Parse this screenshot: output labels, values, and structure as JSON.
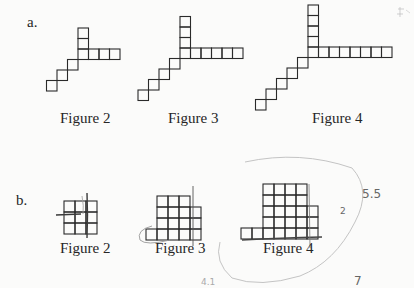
{
  "part_a": {
    "letter": "a.",
    "square_size": 10.5,
    "figures": [
      {
        "label": "Figure 2",
        "label_x": 60,
        "label_y": 111,
        "junction": [
          78,
          49
        ],
        "up": 2,
        "right": 3,
        "diag": 3
      },
      {
        "label": "Figure 3",
        "label_x": 168,
        "label_y": 111,
        "junction": [
          180,
          48
        ],
        "up": 3,
        "right": 5,
        "diag": 4
      },
      {
        "label": "Figure 4",
        "label_x": 312,
        "label_y": 111,
        "junction": [
          308,
          47
        ],
        "up": 4,
        "right": 7,
        "diag": 5
      }
    ]
  },
  "part_b": {
    "letter": "b.",
    "square_size": 11,
    "figures": [
      {
        "label": "Figure 2",
        "label_x": 60,
        "label_y": 241,
        "origin": [
          64,
          234
        ],
        "rows": [
          {
            "start": 0,
            "count": 3
          },
          {
            "start": 0,
            "count": 3
          },
          {
            "start": 0,
            "count": 3
          }
        ]
      },
      {
        "label": "Figure 3",
        "label_x": 155,
        "label_y": 241,
        "origin": [
          157,
          240
        ],
        "rows": [
          {
            "start": -1,
            "count": 5
          },
          {
            "start": 0,
            "count": 4
          },
          {
            "start": 0,
            "count": 4
          },
          {
            "start": 0,
            "count": 3
          }
        ]
      },
      {
        "label": "Figure 4",
        "label_x": 263,
        "label_y": 241,
        "origin": [
          263,
          239
        ],
        "rows": [
          {
            "start": -2,
            "count": 7
          },
          {
            "start": 0,
            "count": 5
          },
          {
            "start": 0,
            "count": 5
          },
          {
            "start": 0,
            "count": 4
          },
          {
            "start": 0,
            "count": 4
          }
        ]
      }
    ]
  },
  "annotations": {
    "note_5_5": "5.5",
    "note_2": "2",
    "note_7": "7",
    "note_4_1": "4.1"
  },
  "colors": {
    "ink": "#2a2a2a",
    "pencil": "#555555",
    "light_pencil": "#bdbdbd"
  }
}
